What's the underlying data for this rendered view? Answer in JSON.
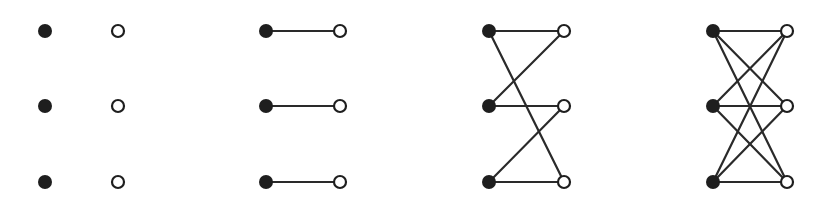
{
  "diagram": {
    "title": "",
    "colors": {
      "edge": "#2a2a2a",
      "filled_node": "#1e1e1e",
      "hollow_fill": "#ffffff",
      "background": "#ffffff"
    },
    "node_radius": 7,
    "graphs": [
      {
        "name": "empty-bipartite",
        "left": [
          [
            45,
            31
          ],
          [
            45,
            106
          ],
          [
            45,
            182
          ]
        ],
        "right": [
          [
            118,
            31
          ],
          [
            118,
            106
          ],
          [
            118,
            182
          ]
        ],
        "edges": []
      },
      {
        "name": "perfect-matching",
        "left": [
          [
            266,
            31
          ],
          [
            266,
            106
          ],
          [
            266,
            182
          ]
        ],
        "right": [
          [
            340,
            31
          ],
          [
            340,
            106
          ],
          [
            340,
            182
          ]
        ],
        "edges": [
          [
            0,
            0
          ],
          [
            1,
            1
          ],
          [
            2,
            2
          ]
        ]
      },
      {
        "name": "two-regular-bipartite",
        "left": [
          [
            489,
            31
          ],
          [
            489,
            106
          ],
          [
            489,
            182
          ]
        ],
        "right": [
          [
            564,
            31
          ],
          [
            564,
            106
          ],
          [
            564,
            182
          ]
        ],
        "edges": [
          [
            0,
            0
          ],
          [
            0,
            2
          ],
          [
            1,
            0
          ],
          [
            1,
            1
          ],
          [
            2,
            1
          ],
          [
            2,
            2
          ]
        ]
      },
      {
        "name": "complete-bipartite-k33",
        "left": [
          [
            713,
            31
          ],
          [
            713,
            106
          ],
          [
            713,
            182
          ]
        ],
        "right": [
          [
            787,
            31
          ],
          [
            787,
            106
          ],
          [
            787,
            182
          ]
        ],
        "edges": [
          [
            0,
            0
          ],
          [
            0,
            1
          ],
          [
            0,
            2
          ],
          [
            1,
            0
          ],
          [
            1,
            1
          ],
          [
            1,
            2
          ],
          [
            2,
            0
          ],
          [
            2,
            1
          ],
          [
            2,
            2
          ]
        ]
      }
    ]
  }
}
